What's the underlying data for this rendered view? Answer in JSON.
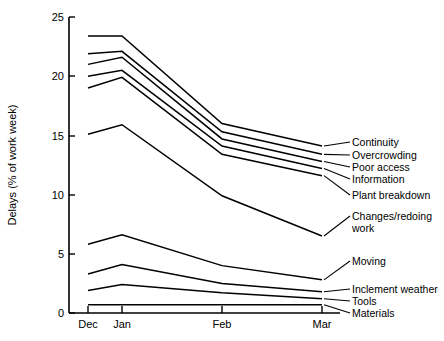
{
  "chart_data": {
    "type": "line",
    "title": "",
    "xlabel": "",
    "ylabel": "Delays (% of work week)",
    "categories": [
      "Dec",
      "Jan",
      "Feb",
      "Mar"
    ],
    "x_positions": [
      88,
      122,
      222,
      322
    ],
    "ylim": [
      0,
      25
    ],
    "yticks": [
      0,
      5,
      10,
      15,
      20,
      25
    ],
    "ytick_labels": [
      "0",
      "5",
      "10",
      "15",
      "20",
      "25"
    ],
    "grid": false,
    "legend_position": "right-inline",
    "series": [
      {
        "name": "Continuity",
        "values": [
          23.4,
          23.4,
          16.0,
          14.1
        ]
      },
      {
        "name": "Overcrowding",
        "values": [
          21.9,
          22.1,
          15.3,
          13.4
        ]
      },
      {
        "name": "Poor access",
        "values": [
          21.0,
          21.6,
          14.7,
          12.8
        ]
      },
      {
        "name": "Information",
        "values": [
          20.0,
          20.5,
          14.1,
          12.2
        ]
      },
      {
        "name": "Plant breakdown",
        "values": [
          19.0,
          19.9,
          13.4,
          11.6
        ]
      },
      {
        "name": "Changes/redoing work",
        "values": [
          15.1,
          15.9,
          9.9,
          6.5
        ]
      },
      {
        "name": "Moving",
        "values": [
          5.8,
          6.6,
          4.0,
          2.8
        ]
      },
      {
        "name": "Inclement weather",
        "values": [
          3.3,
          4.1,
          2.5,
          1.8
        ]
      },
      {
        "name": "Tools",
        "values": [
          1.9,
          2.4,
          1.7,
          1.2
        ]
      },
      {
        "name": "Materials",
        "values": [
          0.7,
          0.7,
          0.7,
          0.7
        ]
      }
    ]
  },
  "legend": {
    "items": [
      {
        "label": "Continuity"
      },
      {
        "label": "Overcrowding"
      },
      {
        "label": "Poor access"
      },
      {
        "label": "Information"
      },
      {
        "label": "Plant breakdown"
      },
      {
        "label": "Changes/redoing"
      },
      {
        "label": "work"
      },
      {
        "label": "Moving"
      },
      {
        "label": "Inclement weather"
      },
      {
        "label": "Tools"
      },
      {
        "label": "Materials"
      }
    ]
  },
  "caption": ""
}
